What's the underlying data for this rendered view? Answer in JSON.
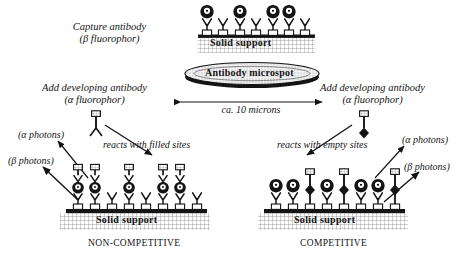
{
  "diagram": {
    "title_hidden": "Microspot immunoassay schematic",
    "labels": {
      "capture_antibody_line1": "Capture antibody",
      "capture_antibody_line2": "(β fluorophor)",
      "add_dev_left_line1": "Add developing antibody",
      "add_dev_left_line2": "(α fluorophor)",
      "add_dev_right_line1": "Add developing antibody",
      "add_dev_right_line2": "(α fluorophor)",
      "scale_bar": "ca. 10 microns",
      "microspot": "Antibody microspot",
      "solid_support_top": "Solid support",
      "solid_support_left": "Solid support",
      "solid_support_right": "Solid support",
      "reacts_filled": "reacts with filled sites",
      "reacts_empty": "reacts with empty sites",
      "alpha_photons_left": "(α photons)",
      "beta_photons_left": "(β photons)",
      "alpha_photons_right": "(α photons)",
      "beta_photons_right": "(β photons)",
      "panel_left_caption": "NON-COMPETITIVE",
      "panel_right_caption": "COMPETITIVE"
    },
    "colors": {
      "ink": "#141414",
      "support_fill": "#000000",
      "hatch": "#9a9a9a",
      "marker_fill": "#ffffff",
      "analyte_fill": "#000000"
    },
    "top_panel": {
      "antibody_count": 7,
      "beta_labelled_count": 4,
      "unlabelled_count": 3,
      "pattern": [
        "beta",
        "plain",
        "beta",
        "plain",
        "beta",
        "beta",
        "plain"
      ]
    },
    "left_panel": {
      "site_count": 8,
      "filled_sites": 5,
      "developing_antibody_count": 5,
      "pattern": [
        "filled",
        "filled",
        "empty",
        "filled",
        "empty",
        "filled",
        "filled",
        "empty"
      ]
    },
    "right_panel": {
      "site_count": 8,
      "capture_count": 8,
      "competitor_bound_count": 3,
      "pattern": [
        "beta",
        "beta",
        "comp",
        "beta",
        "comp",
        "beta",
        "beta",
        "comp"
      ]
    }
  }
}
